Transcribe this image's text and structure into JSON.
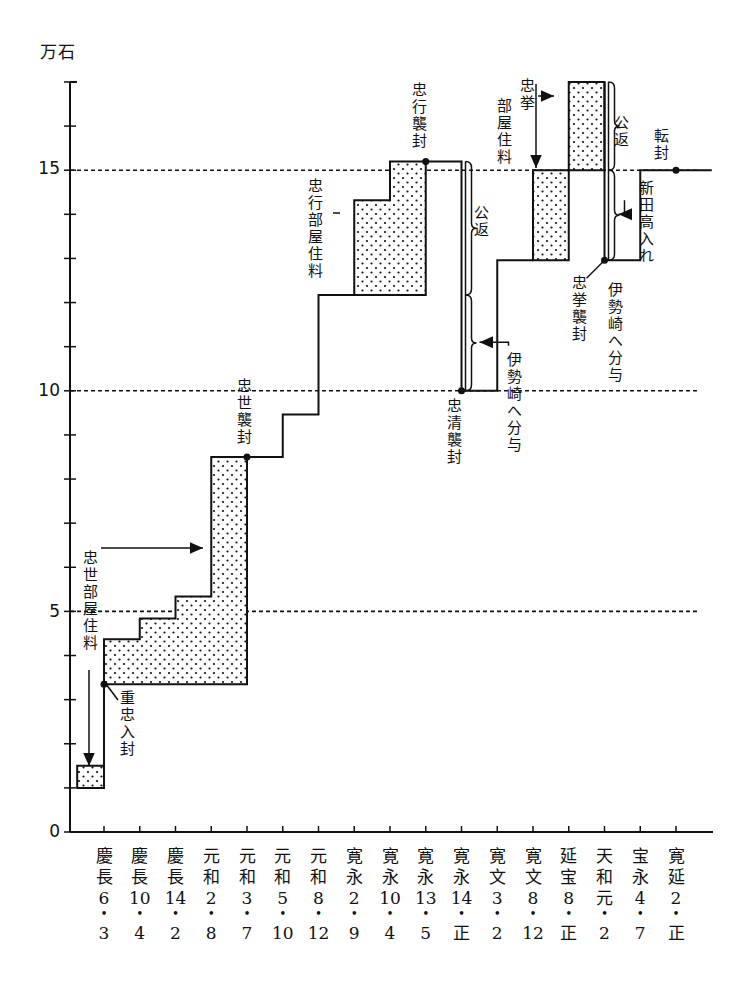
{
  "chart_data": {
    "type": "line",
    "subtype": "step-chart with shaded allowance blocks",
    "ylabel": "万石",
    "ylim": [
      0,
      17
    ],
    "yticks_major": [
      0,
      5,
      10,
      15
    ],
    "yticks_minor_step": 1,
    "gridlines_dashed_at": [
      5,
      10,
      15
    ],
    "categories": [
      {
        "era": "慶長",
        "year": "6",
        "month": "3"
      },
      {
        "era": "慶長",
        "year": "10",
        "month": "4"
      },
      {
        "era": "慶長",
        "year": "14",
        "month": "2"
      },
      {
        "era": "元和",
        "year": "2",
        "month": "8"
      },
      {
        "era": "元和",
        "year": "3",
        "month": "7"
      },
      {
        "era": "元和",
        "year": "5",
        "month": "10"
      },
      {
        "era": "元和",
        "year": "8",
        "month": "12"
      },
      {
        "era": "寛永",
        "year": "2",
        "month": "9"
      },
      {
        "era": "寛永",
        "year": "10",
        "month": "4"
      },
      {
        "era": "寛永",
        "year": "13",
        "month": "5"
      },
      {
        "era": "寛永",
        "year": "14",
        "month": "正"
      },
      {
        "era": "寛文",
        "year": "3",
        "month": "2"
      },
      {
        "era": "寛文",
        "year": "8",
        "month": "12"
      },
      {
        "era": "延宝",
        "year": "8",
        "month": "正"
      },
      {
        "era": "天和",
        "year": "元",
        "month": "2"
      },
      {
        "era": "宝永",
        "year": "4",
        "month": "7"
      },
      {
        "era": "寛延",
        "year": "2",
        "month": "正"
      }
    ],
    "series": [
      {
        "name": "領知高 (main step line)",
        "segments": [
          [
            [
              0,
              1.5
            ],
            [
              0,
              3.35
            ]
          ],
          [
            [
              4,
              8.5
            ],
            [
              5,
              8.5
            ],
            [
              5,
              9.46
            ],
            [
              6,
              9.46
            ],
            [
              6,
              12.17
            ],
            [
              7,
              12.17
            ]
          ],
          [
            [
              9,
              15.2
            ],
            [
              10,
              15.2
            ],
            [
              10,
              10
            ],
            [
              11,
              10
            ],
            [
              11,
              12.96
            ],
            [
              12,
              12.96
            ]
          ],
          [
            [
              14,
              17
            ],
            [
              14,
              12.96
            ],
            [
              15,
              12.96
            ],
            [
              15,
              15
            ],
            [
              17,
              15
            ]
          ]
        ]
      },
      {
        "name": "部屋住料 (shaded blocks)",
        "polygons": [
          [
            [
              -0.75,
              1.0
            ],
            [
              0,
              1.0
            ],
            [
              0,
              1.5
            ],
            [
              -0.75,
              1.5
            ]
          ],
          [
            [
              0,
              3.35
            ],
            [
              4,
              3.35
            ],
            [
              4,
              8.5
            ],
            [
              3,
              8.5
            ],
            [
              3,
              5.34
            ],
            [
              2,
              5.34
            ],
            [
              2,
              4.84
            ],
            [
              1,
              4.84
            ],
            [
              1,
              4.37
            ],
            [
              0,
              4.37
            ]
          ],
          [
            [
              7,
              12.17
            ],
            [
              9,
              12.17
            ],
            [
              9,
              15.2
            ],
            [
              8,
              15.2
            ],
            [
              8,
              14.32
            ],
            [
              7,
              14.32
            ]
          ],
          [
            [
              12,
              12.96
            ],
            [
              13,
              12.96
            ],
            [
              13,
              15
            ],
            [
              12,
              15
            ]
          ],
          [
            [
              13,
              15
            ],
            [
              14,
              15
            ],
            [
              14,
              17
            ],
            [
              13,
              17
            ]
          ]
        ]
      }
    ],
    "markers": [
      {
        "at": [
          0,
          3.35
        ],
        "label": "重忠入封"
      },
      {
        "at": [
          4,
          8.5
        ],
        "label": "忠世襲封"
      },
      {
        "at": [
          9,
          15.2
        ],
        "label": "忠行襲封"
      },
      {
        "at": [
          10,
          10
        ],
        "label": "忠清襲封"
      },
      {
        "at": [
          14,
          12.96
        ],
        "label": "忠挙襲封"
      },
      {
        "at": [
          16,
          15
        ],
        "label": "転封"
      }
    ],
    "annotations": [
      {
        "text": "忠世部屋住料",
        "points_to": "shaded block 慶長10–元和3"
      },
      {
        "text": "忠行部屋住料",
        "points_to": "shaded block 寛永2–寛永13"
      },
      {
        "text": "公返",
        "range": [
          12.17,
          15.2
        ],
        "at": "寛永14"
      },
      {
        "text": "伊勢崎へ分与",
        "range": [
          10,
          12.17
        ],
        "at": "寛永14"
      },
      {
        "text": "忠挙部屋住料",
        "points_to": "shaded block 寛文8–延宝8"
      },
      {
        "text": "公返",
        "range": [
          15,
          17
        ],
        "at": "天和元"
      },
      {
        "text": "伊勢崎へ分与",
        "range": [
          13,
          15
        ],
        "at": "天和元"
      },
      {
        "text": "新田高入れ",
        "at": "宝永4"
      }
    ]
  },
  "labels": {
    "unit": "万石",
    "y0": "0",
    "y5": "5",
    "y10": "10",
    "y15": "15",
    "chuusei_heyazumi": "忠世部屋住料",
    "shigetada_nyuufuu": "重忠入封",
    "chuusei_shuufuu": "忠世襲封",
    "chuukou_heyazumi": "忠行部屋住料",
    "chuukou_shuufuu": "忠行襲封",
    "kouhen1": "公返",
    "isesaki1": "伊勢崎へ分与",
    "chuusei2_shuufuu": "忠清襲封",
    "chuukyo_top": "忠挙",
    "chuukyo_heyazumi": "部屋住料",
    "kouhen2": "公返",
    "chuukyo_shuufuu": "忠挙襲封",
    "isesaki2": "伊勢崎へ分与",
    "tenpuu": "転封",
    "shinden": "新田高入れ"
  }
}
